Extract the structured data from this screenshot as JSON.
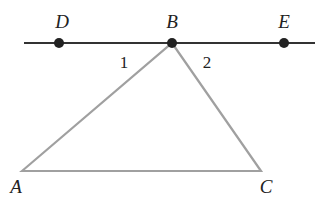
{
  "diagram": {
    "line": {
      "x1": 24,
      "y1": 43,
      "x2": 315,
      "y2": 43,
      "color": "#333333"
    },
    "points": [
      {
        "id": "D",
        "label": "D",
        "x": 59,
        "y": 43,
        "lx": 62,
        "ly": 28,
        "dot": true
      },
      {
        "id": "B",
        "label": "B",
        "x": 172,
        "y": 43,
        "lx": 172,
        "ly": 28,
        "dot": true
      },
      {
        "id": "E",
        "label": "E",
        "x": 284,
        "y": 43,
        "lx": 284,
        "ly": 28,
        "dot": true
      },
      {
        "id": "A",
        "label": "A",
        "x": 22,
        "y": 171,
        "lx": 16,
        "ly": 193,
        "dot": false
      },
      {
        "id": "C",
        "label": "C",
        "x": 261,
        "y": 171,
        "lx": 266,
        "ly": 193,
        "dot": false
      }
    ],
    "triangle": {
      "vertices": [
        "A",
        "B",
        "C"
      ],
      "color": "#a0a0a0"
    },
    "angles": [
      {
        "label": "1",
        "x": 124,
        "y": 68
      },
      {
        "label": "2",
        "x": 207,
        "y": 68
      }
    ]
  }
}
